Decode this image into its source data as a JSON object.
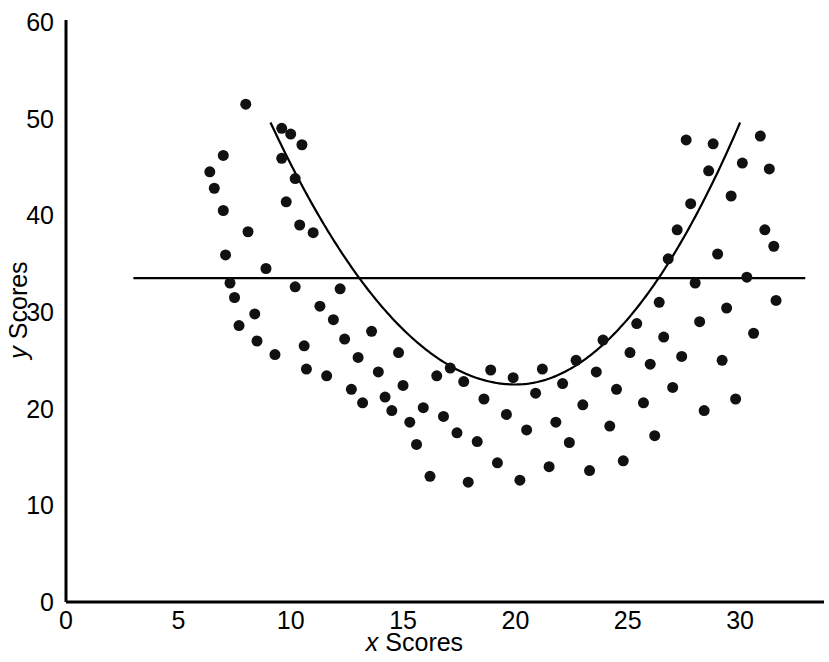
{
  "figure": {
    "background_color": "#ffffff",
    "ink_color": "#000000"
  },
  "chart_data": {
    "type": "scatter",
    "title": "",
    "subtitle": "",
    "xlabel": "x Scores",
    "ylabel": "y Scores",
    "xlabel_var": "x",
    "xlabel_rest": " Scores",
    "ylabel_var": "y",
    "ylabel_rest": " Scores",
    "xlim": [
      0,
      33.7
    ],
    "ylim": [
      0,
      60
    ],
    "xticks": [
      0,
      5,
      10,
      15,
      20,
      25,
      30
    ],
    "yticks": [
      0,
      10,
      20,
      30,
      40,
      50,
      60
    ],
    "xtick_labels": [
      "0",
      "5",
      "10",
      "15",
      "20",
      "25",
      "30"
    ],
    "ytick_labels": [
      "0",
      "10",
      "20",
      "30",
      "40",
      "50",
      "60"
    ],
    "grid": false,
    "legend": null,
    "marker": {
      "shape": "circle",
      "color": "#111111",
      "size_px": 11
    },
    "series": [
      {
        "name": "Observations",
        "type": "scatter",
        "points": [
          [
            6.4,
            44.5
          ],
          [
            6.6,
            42.8
          ],
          [
            7.0,
            46.2
          ],
          [
            7.0,
            40.5
          ],
          [
            7.1,
            35.9
          ],
          [
            7.3,
            33.0
          ],
          [
            7.5,
            31.5
          ],
          [
            7.7,
            28.6
          ],
          [
            8.0,
            51.5
          ],
          [
            8.1,
            38.3
          ],
          [
            8.4,
            29.8
          ],
          [
            8.5,
            27.0
          ],
          [
            8.9,
            34.5
          ],
          [
            9.3,
            25.6
          ],
          [
            9.6,
            49.0
          ],
          [
            9.6,
            45.9
          ],
          [
            9.8,
            41.4
          ],
          [
            10.0,
            48.4
          ],
          [
            10.2,
            43.8
          ],
          [
            10.2,
            32.6
          ],
          [
            10.4,
            39.0
          ],
          [
            10.5,
            47.3
          ],
          [
            10.6,
            26.5
          ],
          [
            10.7,
            24.1
          ],
          [
            11.0,
            38.2
          ],
          [
            11.3,
            30.6
          ],
          [
            11.6,
            23.4
          ],
          [
            11.9,
            29.2
          ],
          [
            12.2,
            32.4
          ],
          [
            12.4,
            27.2
          ],
          [
            12.7,
            22.0
          ],
          [
            13.0,
            25.3
          ],
          [
            13.2,
            20.6
          ],
          [
            13.6,
            28.0
          ],
          [
            13.9,
            23.8
          ],
          [
            14.2,
            21.2
          ],
          [
            14.5,
            19.8
          ],
          [
            14.8,
            25.8
          ],
          [
            15.0,
            22.4
          ],
          [
            15.3,
            18.6
          ],
          [
            15.6,
            16.3
          ],
          [
            15.9,
            20.1
          ],
          [
            16.2,
            13.0
          ],
          [
            16.5,
            23.4
          ],
          [
            16.8,
            19.2
          ],
          [
            17.1,
            24.2
          ],
          [
            17.4,
            17.5
          ],
          [
            17.7,
            22.8
          ],
          [
            17.9,
            12.4
          ],
          [
            18.3,
            16.6
          ],
          [
            18.6,
            21.0
          ],
          [
            18.9,
            24.0
          ],
          [
            19.2,
            14.4
          ],
          [
            19.6,
            19.4
          ],
          [
            19.9,
            23.2
          ],
          [
            20.2,
            12.6
          ],
          [
            20.5,
            17.8
          ],
          [
            20.9,
            21.6
          ],
          [
            21.2,
            24.1
          ],
          [
            21.5,
            14.0
          ],
          [
            21.8,
            18.6
          ],
          [
            22.1,
            22.6
          ],
          [
            22.4,
            16.5
          ],
          [
            22.7,
            25.0
          ],
          [
            23.0,
            20.4
          ],
          [
            23.3,
            13.6
          ],
          [
            23.6,
            23.8
          ],
          [
            23.9,
            27.1
          ],
          [
            24.2,
            18.2
          ],
          [
            24.5,
            22.0
          ],
          [
            24.8,
            14.6
          ],
          [
            25.1,
            25.8
          ],
          [
            25.4,
            28.8
          ],
          [
            25.7,
            20.6
          ],
          [
            26.0,
            24.6
          ],
          [
            26.2,
            17.2
          ],
          [
            26.4,
            31.0
          ],
          [
            26.6,
            27.4
          ],
          [
            26.8,
            35.5
          ],
          [
            27.0,
            22.2
          ],
          [
            27.2,
            38.5
          ],
          [
            27.4,
            25.4
          ],
          [
            27.6,
            47.8
          ],
          [
            27.8,
            41.2
          ],
          [
            28.0,
            33.0
          ],
          [
            28.2,
            29.0
          ],
          [
            28.4,
            19.8
          ],
          [
            28.6,
            44.6
          ],
          [
            28.8,
            47.4
          ],
          [
            29.0,
            36.0
          ],
          [
            29.2,
            25.0
          ],
          [
            29.4,
            30.4
          ],
          [
            29.6,
            42.0
          ],
          [
            29.8,
            21.0
          ],
          [
            30.1,
            45.4
          ],
          [
            30.3,
            33.6
          ],
          [
            30.6,
            27.8
          ],
          [
            30.9,
            48.2
          ],
          [
            31.1,
            38.5
          ],
          [
            31.3,
            44.8
          ],
          [
            31.5,
            36.8
          ],
          [
            31.6,
            31.2
          ]
        ]
      }
    ],
    "annotations": [
      {
        "name": "horizontal-mean-line",
        "type": "hline",
        "y": 33.5,
        "x_start": 3.0,
        "x_end": 32.9,
        "color": "#000000",
        "width_px": 2.2,
        "description": "Horizontal line at y = 33.5"
      },
      {
        "name": "quadratic-curve",
        "type": "curve",
        "shape": "u-shaped parabola",
        "vertex": [
          20.0,
          22.5
        ],
        "x_start": 9.1,
        "x_end": 30.0,
        "y_at_x_start": 49.6,
        "y_at_x_end": 49.6,
        "color": "#000000",
        "width_px": 2.2,
        "description": "U-shaped curvilinear regression curve fitted to the scatter"
      }
    ]
  }
}
